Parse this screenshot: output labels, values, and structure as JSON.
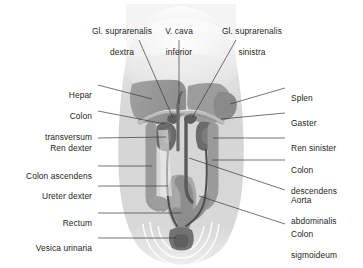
{
  "figure": {
    "kind": "anatomical-illustration",
    "background_color": "#ffffff",
    "label_text_color": "#231f20",
    "leader_line_color": "#3a3a3a",
    "body_silhouette_color": "#d9d9d9",
    "organ_mid_gray": "#9a9a9a",
    "organ_dark_gray": "#6e6e6e",
    "organ_light_gray": "#bdbdbd",
    "highlight_white": "#f2f2f2"
  },
  "labels": {
    "top": [
      {
        "id": "gl-suprarenalis-dextra",
        "line1": "Gl. suprarenalis",
        "line2": "dextra"
      },
      {
        "id": "v-cava-inferior",
        "line1": "V. cava",
        "line2": "inferior"
      },
      {
        "id": "gl-suprarenalis-sinistra",
        "line1": "Gl. suprarenalis",
        "line2": "sinistra"
      }
    ],
    "left": [
      {
        "id": "hepar",
        "line1": "Hepar",
        "line2": ""
      },
      {
        "id": "colon-transversum",
        "line1": "Colon",
        "line2": "transversum"
      },
      {
        "id": "ren-dexter",
        "line1": "Ren dexter",
        "line2": ""
      },
      {
        "id": "colon-ascendens",
        "line1": "Colon ascendens",
        "line2": ""
      },
      {
        "id": "ureter-dexter",
        "line1": "Ureter dexter",
        "line2": ""
      },
      {
        "id": "rectum",
        "line1": "Rectum",
        "line2": ""
      },
      {
        "id": "vesica-urinaria",
        "line1": "Vesica urinaria",
        "line2": ""
      }
    ],
    "right": [
      {
        "id": "splen",
        "line1": "Splen",
        "line2": ""
      },
      {
        "id": "gaster",
        "line1": "Gaster",
        "line2": ""
      },
      {
        "id": "ren-sinister",
        "line1": "Ren sinister",
        "line2": ""
      },
      {
        "id": "colon-descendens",
        "line1": "Colon",
        "line2": "descendens"
      },
      {
        "id": "aorta-abdominalis",
        "line1": "Aorta",
        "line2": "abdominalis"
      },
      {
        "id": "colon-sigmoideum",
        "line1": "Colon",
        "line2": "sigmoideum"
      }
    ]
  }
}
